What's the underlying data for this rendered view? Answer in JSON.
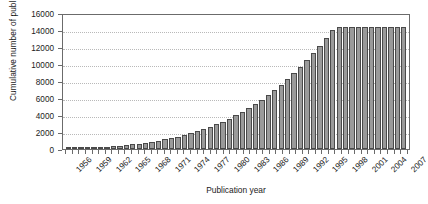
{
  "chart_data": {
    "type": "bar",
    "title": "",
    "xlabel": "Publication year",
    "ylabel": "Cumulative number of publications",
    "ylim": [
      0,
      16000
    ],
    "ytick_values": [
      0,
      2000,
      4000,
      6000,
      8000,
      10000,
      12000,
      14000,
      16000
    ],
    "ytick_labels": [
      "0",
      "2000",
      "4000",
      "6000",
      "8000",
      "10000",
      "12000",
      "14000",
      "16000"
    ],
    "grid": true,
    "grid_axis": "y",
    "legend": false,
    "bar_color": "#9a9a9a",
    "bar_edge_color": "#4a4a4a",
    "axis_color": "#6b6b6b",
    "grid_color": "#b9b9b9",
    "xtick_rotation": -45,
    "xtick_label_step": 3,
    "categories": [
      "1956",
      "1957",
      "1958",
      "1959",
      "1960",
      "1961",
      "1962",
      "1963",
      "1964",
      "1965",
      "1966",
      "1967",
      "1968",
      "1969",
      "1970",
      "1971",
      "1972",
      "1973",
      "1974",
      "1975",
      "1976",
      "1977",
      "1978",
      "1979",
      "1980",
      "1981",
      "1982",
      "1983",
      "1984",
      "1985",
      "1986",
      "1987",
      "1988",
      "1989",
      "1990",
      "1991",
      "1992",
      "1993",
      "1994",
      "1995",
      "1996",
      "1997",
      "1998",
      "1999",
      "2000",
      "2001",
      "2002",
      "2003",
      "2004",
      "2005",
      "2006",
      "2007",
      "2008"
    ],
    "xtick_labels_shown": [
      "1956",
      "1959",
      "1962",
      "1965",
      "1968",
      "1971",
      "1974",
      "1977",
      "1980",
      "1983",
      "1986",
      "1989",
      "1992",
      "1995",
      "1998",
      "2001",
      "2004",
      "2007"
    ],
    "values": [
      20,
      45,
      75,
      110,
      150,
      200,
      255,
      315,
      385,
      460,
      545,
      640,
      745,
      860,
      985,
      1125,
      1280,
      1450,
      1640,
      1850,
      2080,
      2330,
      2600,
      2900,
      3230,
      3580,
      3960,
      4370,
      4810,
      5280,
      5790,
      6330,
      6910,
      7530,
      8200,
      8920,
      9700,
      10500,
      11300,
      12150,
      13050,
      14000,
      15000,
      16050,
      17150,
      18300,
      19500,
      20750,
      22050,
      23400,
      24800,
      26250,
      27750
    ],
    "values_plotted": [
      20,
      45,
      75,
      110,
      150,
      200,
      255,
      315,
      385,
      460,
      545,
      640,
      745,
      860,
      985,
      1125,
      1280,
      1450,
      1640,
      1850,
      2080,
      2330,
      2600,
      2900,
      3230,
      3580,
      3960,
      4370,
      4810,
      5280,
      5790,
      6330,
      6910,
      7530,
      8200,
      8920,
      9700,
      10500,
      11300,
      12150,
      13050,
      14000,
      14400,
      14400,
      14400,
      14400,
      14400,
      14400,
      14400,
      14400,
      14400,
      14400,
      14400
    ]
  }
}
